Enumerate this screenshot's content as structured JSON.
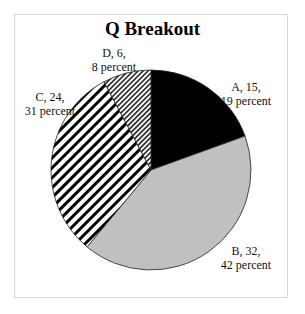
{
  "chart_data": {
    "type": "pie",
    "title": "Q Breakout",
    "categories": [
      "A",
      "B",
      "C",
      "D"
    ],
    "values": [
      15,
      32,
      24,
      6
    ],
    "percents": [
      19,
      42,
      31,
      8
    ],
    "labels": [
      {
        "line1": "A, 15,",
        "line2": "19 percent"
      },
      {
        "line1": "B, 32,",
        "line2": "42 percent"
      },
      {
        "line1": "C, 24,",
        "line2": "31 percent"
      },
      {
        "line1": "D, 6,",
        "line2": "8 percent"
      }
    ],
    "fills": [
      "solid-black",
      "light-gray",
      "wide-diagonal-stripes",
      "narrow-diagonal-stripes"
    ],
    "colors": {
      "A": "#000000",
      "B": "#c0c0c0",
      "C": "#000000",
      "D": "#333333"
    },
    "start_angle": "12 o'clock, clockwise",
    "legend": "none (data labels)"
  },
  "caption": "Figure ..."
}
